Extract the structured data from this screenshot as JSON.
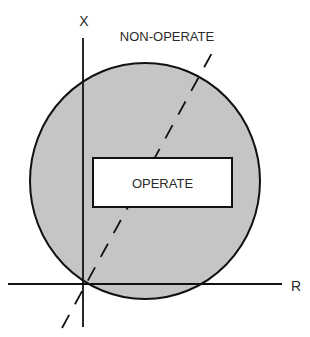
{
  "diagram": {
    "axes": {
      "vertical_label": "X",
      "horizontal_label": "R"
    },
    "regions": {
      "outer_label": "NON-OPERATE",
      "inner_label": "OPERATE"
    },
    "colors": {
      "fill": "#c4c6c6",
      "stroke": "#111111",
      "box_fill": "#ffffff"
    }
  }
}
